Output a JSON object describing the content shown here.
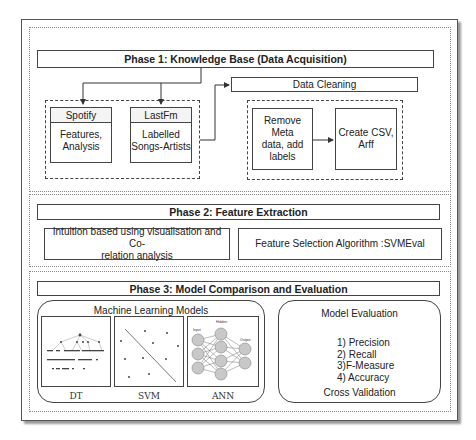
{
  "phase1": {
    "title": "Phase 1: Knowledge Base (Data Acquisition)",
    "sources": [
      {
        "header": "Spotify",
        "body_lines": [
          "Features,",
          "Analysis"
        ]
      },
      {
        "header": "LastFm",
        "body_lines": [
          "Labelled",
          "Songs-Artists"
        ]
      }
    ],
    "cleaning": {
      "title": "Data Cleaning",
      "steps": [
        {
          "lines": [
            "Remove Meta",
            "data, add",
            "labels"
          ]
        },
        {
          "lines": [
            "Create CSV,",
            "Arff"
          ]
        }
      ]
    }
  },
  "phase2": {
    "title": "Phase 2: Feature Extraction",
    "methods": [
      {
        "lines": [
          "Intuition based using visualisation and Co-",
          "relation analysis"
        ]
      },
      {
        "lines": [
          "Feature Selection Algorithm :SVMEval"
        ]
      }
    ]
  },
  "phase3": {
    "title": "Phase 3: Model Comparison and Evaluation",
    "models": {
      "title": "Machine Learning Models",
      "items": [
        {
          "label": "DT",
          "icon": "decision-tree-icon"
        },
        {
          "label": "SVM",
          "icon": "svm-scatter-icon"
        },
        {
          "label": "ANN",
          "icon": "neural-network-icon",
          "layer_labels": [
            "Input",
            "Hidden",
            "Output"
          ]
        }
      ]
    },
    "evaluation": {
      "title": "Model Evaluation",
      "metrics": [
        "1) Precision",
        "2) Recall",
        "3)F-Measure",
        "4) Accuracy"
      ],
      "footer": "Cross Validation"
    }
  },
  "colors": {
    "border": "#444444",
    "dotted": "#888888",
    "header_fill": "#f4f4f4",
    "node_fill": "#c8c8c8"
  }
}
